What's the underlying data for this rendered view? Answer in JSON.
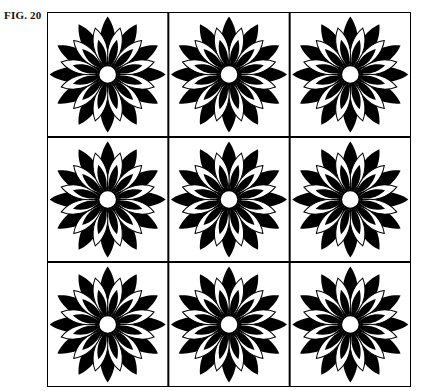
{
  "figure": {
    "label": "FIG. 20",
    "rows": 3,
    "cols": 3,
    "motif": "stylized chrysanthemum flower with alternating black and outlined petals and a white center",
    "colors": {
      "ink": "#000000",
      "paper": "#ffffff"
    }
  }
}
